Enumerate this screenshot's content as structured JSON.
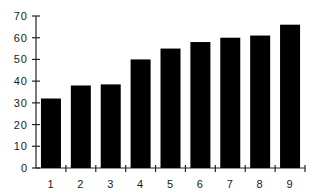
{
  "chart_data": {
    "type": "bar",
    "title": "",
    "xlabel": "",
    "ylabel": "",
    "categories": [
      "1",
      "2",
      "3",
      "4",
      "5",
      "6",
      "7",
      "8",
      "9"
    ],
    "values": [
      32,
      38,
      38.5,
      50,
      55,
      58,
      60,
      61,
      66
    ],
    "ylim": [
      0,
      70
    ],
    "yticks": [
      0,
      10,
      20,
      30,
      40,
      50,
      60,
      70
    ],
    "grid": false,
    "legend": null,
    "bar_color": "#000000"
  }
}
